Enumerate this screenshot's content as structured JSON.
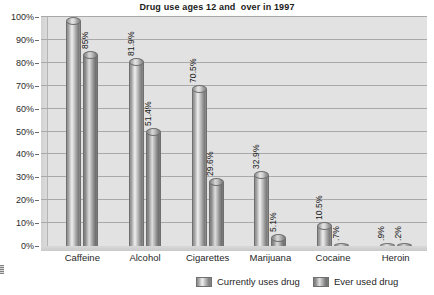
{
  "chart_data": {
    "type": "bar",
    "title": "Drug use ages 12 and  over in 1997",
    "xlabel": "",
    "ylabel": "",
    "ylim": [
      0,
      100
    ],
    "ytick_labels": [
      "100%",
      "90%",
      "80%",
      "70%",
      "60%",
      "50%",
      "40%",
      "30%",
      "20%",
      "10%",
      "0%"
    ],
    "ytick_values": [
      100,
      90,
      80,
      70,
      60,
      50,
      40,
      30,
      20,
      10,
      0
    ],
    "grid": true,
    "legend_position": "bottom",
    "categories": [
      "Caffeine",
      "Alcohol",
      "Cigarettes",
      "Marijuana",
      "Cocaine",
      "Heroin"
    ],
    "series": [
      {
        "name": "Currently uses drug",
        "values": [
          100,
          81.9,
          70.5,
          32.9,
          10.5,
          0.9
        ],
        "labels": [
          "",
          "81.9%",
          "70.5%",
          "32.9%",
          "10.5%",
          ".9%"
        ]
      },
      {
        "name": "Ever used drug",
        "values": [
          85,
          51.4,
          29.6,
          5.1,
          0.7,
          0.2
        ],
        "labels": [
          "85%",
          "51.4%",
          "29.6%",
          "5.1%",
          ".7%",
          ".2%"
        ]
      }
    ]
  },
  "legend": {
    "items": [
      {
        "label": "Currently uses drug"
      },
      {
        "label": "Ever used drug"
      }
    ]
  }
}
